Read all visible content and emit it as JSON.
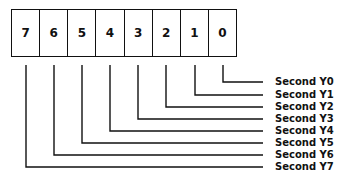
{
  "register": {
    "bits": [
      "7",
      "6",
      "5",
      "4",
      "3",
      "2",
      "1",
      "0"
    ]
  },
  "outputs": [
    {
      "bit": "0",
      "label": "Second Y0"
    },
    {
      "bit": "1",
      "label": "Second Y1"
    },
    {
      "bit": "2",
      "label": "Second Y2"
    },
    {
      "bit": "3",
      "label": "Second Y3"
    },
    {
      "bit": "4",
      "label": "Second Y4"
    },
    {
      "bit": "5",
      "label": "Second Y5"
    },
    {
      "bit": "6",
      "label": "Second Y6"
    },
    {
      "bit": "7",
      "label": "Second Y7"
    }
  ]
}
